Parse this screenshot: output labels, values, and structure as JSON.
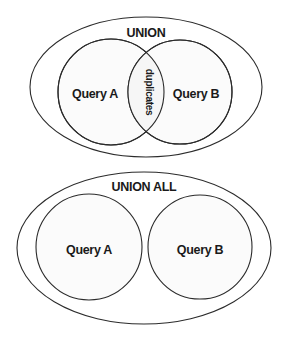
{
  "diagrams": [
    {
      "title": "UNION",
      "left_set": "Query A",
      "right_set": "Query B",
      "overlap_label": "duplicates",
      "overlapping": true
    },
    {
      "title": "UNION ALL",
      "left_set": "Query A",
      "right_set": "Query B",
      "overlapping": false
    }
  ]
}
